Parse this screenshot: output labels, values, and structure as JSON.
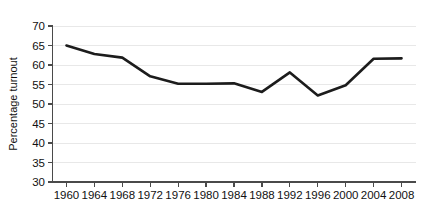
{
  "chart_data": {
    "type": "line",
    "title": "",
    "xlabel": "",
    "ylabel": "Percentage turnout",
    "categories": [
      "1960",
      "1964",
      "1968",
      "1972",
      "1976",
      "1980",
      "1984",
      "1988",
      "1992",
      "1996",
      "2000",
      "2004",
      "2008"
    ],
    "x": [
      1960,
      1964,
      1968,
      1972,
      1976,
      1980,
      1984,
      1988,
      1992,
      1996,
      2000,
      2004,
      2008
    ],
    "values": [
      65.0,
      62.8,
      61.9,
      57.1,
      55.2,
      55.2,
      55.3,
      53.1,
      58.1,
      52.2,
      54.8,
      61.6,
      61.7
    ],
    "series": [
      {
        "name": "Percentage turnout",
        "values": [
          65.0,
          62.8,
          61.9,
          57.1,
          55.2,
          55.2,
          55.3,
          53.1,
          58.1,
          52.2,
          54.8,
          61.6,
          61.7
        ]
      }
    ],
    "ylim": [
      30,
      70
    ],
    "yticks": [
      30,
      35,
      40,
      45,
      50,
      55,
      60,
      65,
      70
    ],
    "ytick_labels": [
      "30",
      "35",
      "40",
      "45",
      "50",
      "55",
      "60",
      "65",
      "70"
    ],
    "xlim": [
      1958,
      2010
    ],
    "grid": true,
    "grid_axis": "y",
    "legend": false,
    "legend_position": "none",
    "line_color": "#1c1c1c",
    "grid_color": "#e8e8e8",
    "axis_color": "#4a4a4a"
  }
}
